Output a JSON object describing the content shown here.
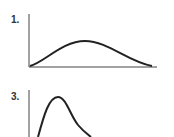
{
  "panels": [
    {
      "label": "1.",
      "description": "symmetric bell-shaped curve",
      "curve_path": "M30,66 C45,62 62,41 85,41 C108,41 128,62 152,66"
    },
    {
      "label": "3.",
      "description": "right-skewed curve with early sharp peak",
      "curve_path": "M38,137 C44,115 49,97 58,97 C66,97 70,115 78,125 C83,131 87,134 91,137"
    }
  ],
  "colors": {
    "stroke": "#222222",
    "axis": "#444444",
    "background": "#ffffff"
  }
}
